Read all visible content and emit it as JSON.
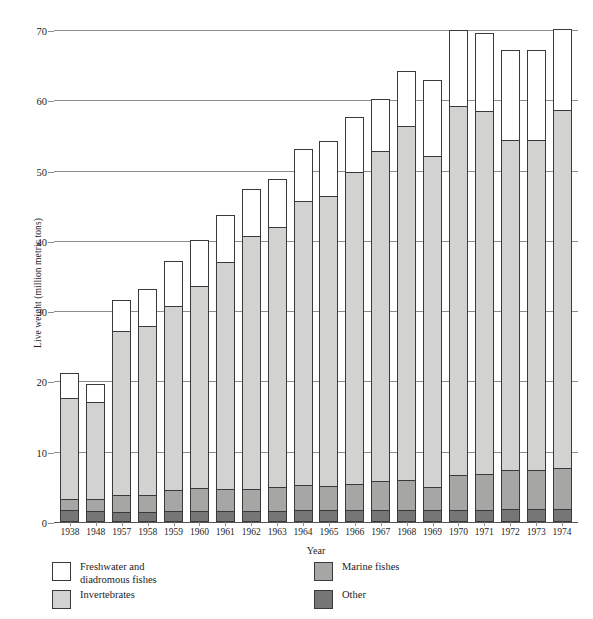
{
  "chart_data": {
    "type": "bar",
    "subtype": "stacked-vertical",
    "title": "",
    "xlabel": "Year",
    "ylabel": "Live weight (million metric tons)",
    "ylim": [
      0,
      70
    ],
    "yticks": [
      0,
      10,
      20,
      30,
      40,
      50,
      60,
      70
    ],
    "ytick_labels": [
      "0",
      "10",
      "20",
      "30",
      "40",
      "50",
      "60",
      "70"
    ],
    "grid": "horizontal",
    "legend_position": "below-axes",
    "stack_order_bottom_to_top": [
      "Other",
      "Marine fishes",
      "Invertebrates",
      "Freshwater and diadromous fishes"
    ],
    "categories": [
      "1938",
      "1948",
      "1957",
      "1958",
      "1959",
      "1960",
      "1961",
      "1962",
      "1963",
      "1964",
      "1965",
      "1966",
      "1967",
      "1968",
      "1969",
      "1970",
      "1971",
      "1972",
      "1973",
      "1974"
    ],
    "series": [
      {
        "name": "Other",
        "color": "#767676",
        "values": [
          1.5,
          1.4,
          1.3,
          1.3,
          1.4,
          1.4,
          1.4,
          1.4,
          1.4,
          1.5,
          1.5,
          1.5,
          1.6,
          1.6,
          1.5,
          1.6,
          1.6,
          1.7,
          1.7,
          1.7
        ]
      },
      {
        "name": "Marine fishes",
        "color": "#a6a6a4",
        "values": [
          1.6,
          1.8,
          2.4,
          2.4,
          3.0,
          3.3,
          3.2,
          3.1,
          3.4,
          3.6,
          3.5,
          3.8,
          4.1,
          4.2,
          3.4,
          4.9,
          5.1,
          5.6,
          5.6,
          5.8
        ]
      },
      {
        "name": "Invertebrates",
        "color": "#d2d2d0",
        "values": [
          14.4,
          13.8,
          23.3,
          24.0,
          26.2,
          28.8,
          32.2,
          36.0,
          37.1,
          40.4,
          41.3,
          44.3,
          46.9,
          50.4,
          47.1,
          52.5,
          51.6,
          46.9,
          46.9,
          51.0
        ]
      },
      {
        "name": "Freshwater and diadromous fishes",
        "color": "#ffffff",
        "values": [
          3.5,
          2.5,
          4.5,
          5.3,
          6.4,
          6.5,
          6.7,
          6.8,
          6.8,
          7.5,
          7.7,
          7.9,
          7.4,
          7.8,
          10.8,
          10.8,
          11.2,
          12.8,
          12.8,
          11.5
        ]
      }
    ],
    "totals": [
      21.0,
      19.5,
      31.5,
      33.0,
      37.0,
      40.0,
      43.5,
      47.3,
      48.7,
      53.0,
      54.0,
      57.5,
      60.0,
      64.0,
      62.8,
      69.8,
      69.5,
      67.0,
      67.0,
      70.0
    ]
  },
  "axes": {
    "ylabel": "Live weight (million metric tons)",
    "xlabel": "Year"
  },
  "legend": {
    "items": [
      {
        "label": "Freshwater and\ndiadromous fishes",
        "swatch": "fresh"
      },
      {
        "label": "Marine fishes",
        "swatch": "mar"
      },
      {
        "label": "Invertebrates",
        "swatch": "inv"
      },
      {
        "label": "Other",
        "swatch": "oth"
      }
    ]
  }
}
